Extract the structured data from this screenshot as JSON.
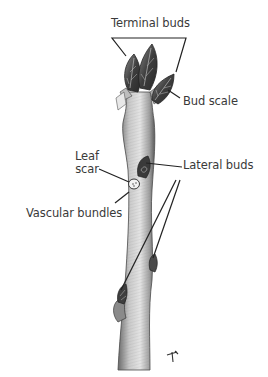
{
  "diagram": {
    "type": "botanical-illustration",
    "labels": {
      "terminal_buds": "Terminal buds",
      "bud_scale": "Bud scale",
      "leaf": "Leaf",
      "scar": "scar",
      "lateral_buds": "Lateral buds",
      "vascular_bundles": "Vascular bundles"
    },
    "signature": "ᚋ"
  },
  "colors": {
    "label_text": "#3a3a3a",
    "leader_line": "#222222",
    "stem_light": "#d9d9d9",
    "stem_dark": "#555555",
    "bud_dark": "#3c3c3c"
  }
}
